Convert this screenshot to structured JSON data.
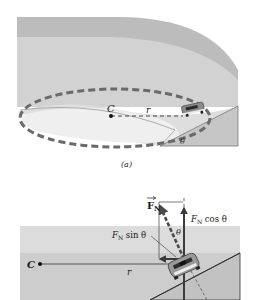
{
  "figure": {
    "panel_a": {
      "caption": "(a)",
      "center_label": "C",
      "radius_label": "r",
      "angle_label": "θ"
    },
    "panel_b": {
      "center_label": "C",
      "radius_label": "r",
      "normal_force_label": "F",
      "normal_force_subscript": "N",
      "vertical_component_label": "F",
      "vertical_component_subscript": "N",
      "vertical_component_suffix": " cos θ",
      "horizontal_component_label": "F",
      "horizontal_component_subscript": "N",
      "horizontal_component_suffix": " sin θ",
      "angle_label": "θ"
    },
    "colors": {
      "track_dark": "#b9b9b9",
      "track_light": "#d9d9d9",
      "track_lighter": "#e6e6e6",
      "infield": "#f0f0f0",
      "bank_face": "#c4c4c4",
      "dashed_path": "#6a6a6a",
      "line": "#2a2a2a"
    }
  }
}
